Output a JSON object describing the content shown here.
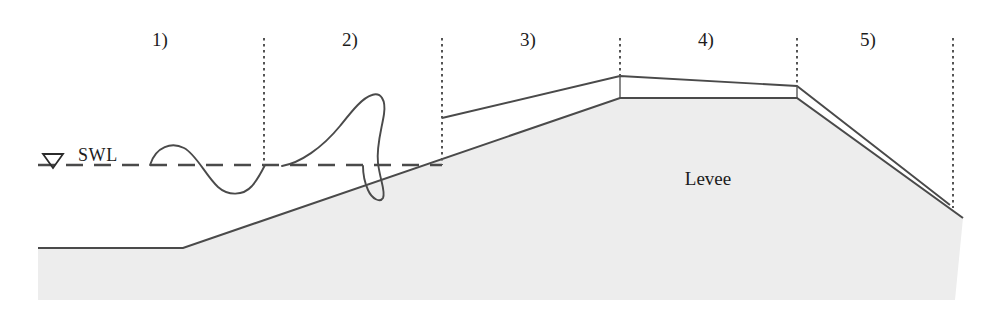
{
  "figure": {
    "type": "cross-section-diagram",
    "background_color": "#ffffff",
    "line_color": "#4a4a4a",
    "text_color": "#1c1c1c",
    "ground_fill_color": "#ededed"
  },
  "zones": [
    {
      "label": "1)",
      "x": 160,
      "y": 40,
      "name": "incident-wave-zone"
    },
    {
      "label": "2)",
      "x": 350,
      "y": 40,
      "name": "breaking-wave-zone"
    },
    {
      "label": "3)",
      "x": 528,
      "y": 40,
      "name": "runup-slope-zone"
    },
    {
      "label": "4)",
      "x": 706,
      "y": 40,
      "name": "crest-overtopping-zone"
    },
    {
      "label": "5)",
      "x": 868,
      "y": 40,
      "name": "landward-slope-zone"
    }
  ],
  "dividers": [
    {
      "name": "divider-1-2",
      "x": 264,
      "y_top": 38,
      "y_bottom": 165
    },
    {
      "name": "divider-2-3",
      "x": 442,
      "y_top": 38,
      "y_bottom": 165
    },
    {
      "name": "divider-3-4",
      "x": 620,
      "y_top": 38,
      "y_bottom": 77
    },
    {
      "name": "divider-4-5",
      "x": 797,
      "y_top": 38,
      "y_bottom": 87
    },
    {
      "name": "divider-5-end",
      "x": 953,
      "y_top": 38,
      "y_bottom": 207
    }
  ],
  "water_level": {
    "label": "SWL",
    "label_x": 80,
    "label_y": 160,
    "y": 165,
    "line_start_x": 38,
    "line_end_x": 442,
    "symbol": "water-level-triangle",
    "symbol_x": 52,
    "symbol_y": 155
  },
  "levee": {
    "label": "Levee",
    "label_x": 708,
    "label_y": 185,
    "seabed_y": 248,
    "seabed_start_x": 40,
    "toe_x": 183,
    "crest_seaward_x": 620,
    "crest_landward_x": 797,
    "crest_surface_y": 98,
    "landward_toe_x": 963,
    "landward_toe_y": 218,
    "bottom_y": 300,
    "left_x": 38,
    "right_x": 955
  },
  "overtopping_layer": {
    "name": "wave-runup-flow-layer",
    "seaward_start_x": 442,
    "seaward_start_y": 118,
    "crest_seaward_y": 76,
    "crest_landward_y": 86,
    "landward_end_x": 950,
    "landward_end_y": 205
  },
  "waves": {
    "incident_wave": {
      "name": "sinusoidal-incident-wave",
      "start_x": 150,
      "end_x": 264,
      "crest_y": 147,
      "trough_y": 193,
      "still_water_y": 165
    },
    "breaking_wave": {
      "name": "plunging-breaking-wave",
      "start_x": 282,
      "peak_x": 368,
      "peak_y": 95,
      "end_x": 392,
      "end_y": 200
    }
  }
}
